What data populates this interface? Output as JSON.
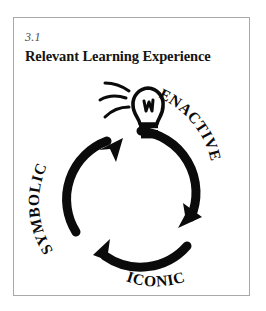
{
  "figure": {
    "number": "3.1",
    "title": "Relevant Learning Experience"
  },
  "diagram": {
    "type": "cycle",
    "direction": "clockwise",
    "center_icon": "lightbulb-icon",
    "stages": [
      {
        "key": "enactive",
        "label": "ENACTIVE",
        "position": "upper-right"
      },
      {
        "key": "iconic",
        "label": "ICONIC",
        "position": "bottom"
      },
      {
        "key": "symbolic",
        "label": "SYMBOLIC",
        "position": "left"
      }
    ],
    "arrow_count": 3
  },
  "colors": {
    "ink": "#0b0b0b",
    "frame": "#a8a8a8",
    "background": "#ffffff",
    "caption": "#4c4c4c"
  }
}
